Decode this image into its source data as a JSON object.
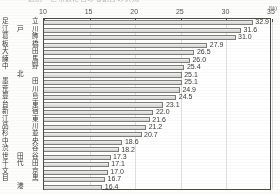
{
  "unit_label": "(%)",
  "title_clipped": "区別・世帯数に占める割合の状況",
  "chart_data": {
    "type": "bar",
    "orientation": "horizontal",
    "title": "",
    "xlabel": "(%)",
    "ylabel": "",
    "xlim": [
      10,
      35
    ],
    "xticks": [
      10,
      15,
      20,
      25,
      30,
      35
    ],
    "grid": true,
    "legend": false,
    "categories": [
      "足立",
      "江戸川",
      "葛飾",
      "板橋",
      "大田",
      "練馬",
      "中野",
      "北",
      "墨田",
      "荒川",
      "豊島",
      "台東",
      "新宿",
      "江東",
      "品川",
      "杉並",
      "中央",
      "渋谷",
      "世田谷",
      "千代田",
      "文京",
      "目黒",
      "港"
    ],
    "values": [
      32.9,
      31.6,
      31.0,
      27.9,
      26.5,
      26.0,
      25.4,
      25.1,
      25.1,
      24.9,
      24.5,
      23.1,
      22.0,
      21.6,
      21.2,
      20.7,
      18.6,
      18.2,
      17.3,
      17.1,
      17.0,
      16.7,
      16.4
    ],
    "value_labels": [
      "32.9",
      "31.6",
      "31.0",
      "27.9",
      "26.5",
      "26.0",
      "25.4",
      "25.1",
      "25.1",
      "24.9",
      "24.5",
      "23.1",
      "22.0",
      "21.6",
      "21.2",
      "20.7",
      "18.6",
      "18.2",
      "17.3",
      "17.1",
      "17.0",
      "16.7",
      "16.4"
    ]
  },
  "colors": {
    "bar_fill": "#e3e3df",
    "bar_stroke": "#7d7d79",
    "axis": "#4a4a48",
    "text": "#3a3a38",
    "grid": "#969693",
    "background": "#fdfdfc"
  }
}
